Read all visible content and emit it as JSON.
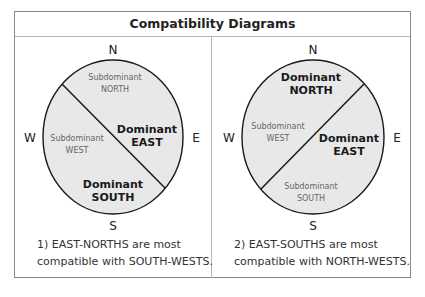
{
  "title": "Compatibility Diagrams",
  "colors": {
    "circle_fill": "#e8e8e8",
    "stroke": "#1a1a1a",
    "sub_text": "#666666",
    "dom_text": "#1a1a1a",
    "frame": "#8a8a8a"
  },
  "diagrams": [
    {
      "compass": {
        "n": "N",
        "s": "S",
        "w": "W",
        "e": "E"
      },
      "regions": {
        "north": {
          "line1": "Subdominant",
          "line2": "NORTH"
        },
        "west": {
          "line1": "Subdominant",
          "line2": "WEST"
        },
        "east": {
          "line1": "Dominant",
          "line2": "EAST"
        },
        "south": {
          "line1": "Dominant",
          "line2": "SOUTH"
        }
      },
      "caption": {
        "line1": "1) EAST-NORTHS are most",
        "line2": "compatible with SOUTH-WESTS."
      }
    },
    {
      "compass": {
        "n": "N",
        "s": "S",
        "w": "W",
        "e": "E"
      },
      "regions": {
        "north": {
          "line1": "Dominant",
          "line2": "NORTH"
        },
        "west": {
          "line1": "Subdominant",
          "line2": "WEST"
        },
        "east": {
          "line1": "Dominant",
          "line2": "EAST"
        },
        "south": {
          "line1": "Subdominant",
          "line2": "SOUTH"
        }
      },
      "caption": {
        "line1": "2) EAST-SOUTHS are most",
        "line2": "compatible with NORTH-WESTS."
      }
    }
  ]
}
